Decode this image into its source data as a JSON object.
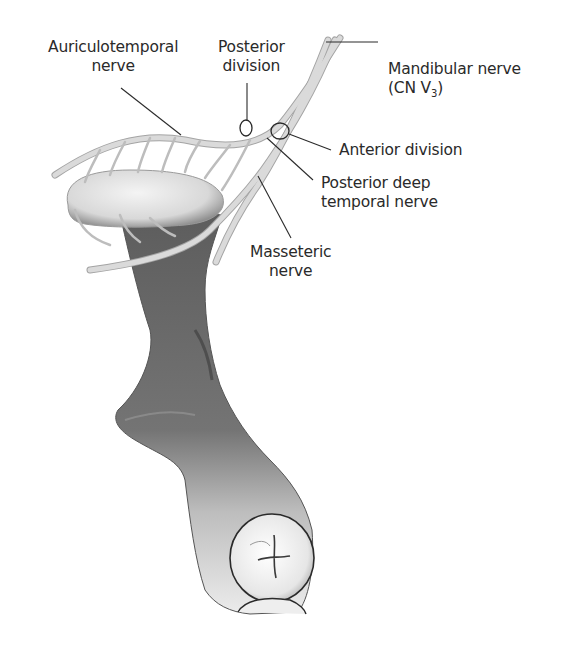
{
  "figure": {
    "colors": {
      "background": "#ffffff",
      "nerve": "#d6d6d6",
      "nerve_outline": "#a8a8a8",
      "bone_dark": "#6e6e6e",
      "bone_light": "#e8e8e8",
      "leader": "#2a2a2a",
      "text": "#2a2a2a"
    }
  },
  "labels": {
    "auriculotemporal": {
      "line1": "Auriculotemporal",
      "line2": "nerve"
    },
    "posterior_division": {
      "line1": "Posterior",
      "line2": "division"
    },
    "mandibular": {
      "line1": "Mandibular nerve",
      "line2_prefix": "(CN V",
      "line2_sub": "3",
      "line2_suffix": ")"
    },
    "anterior_division": {
      "line1": "Anterior division"
    },
    "posterior_deep_temporal": {
      "line1": "Posterior deep",
      "line2": "temporal nerve"
    },
    "masseteric": {
      "line1": "Masseteric",
      "line2": "nerve"
    }
  }
}
